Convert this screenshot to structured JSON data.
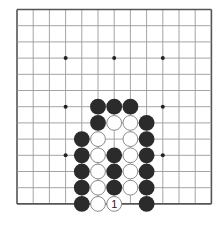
{
  "board": {
    "columns": 13,
    "rows": 13,
    "origin_x": 17,
    "origin_y": 9.5,
    "spacing": 16.2,
    "line_color": "#9a9a9a",
    "edge_color": "#555555",
    "star_points": [
      [
        3,
        3
      ],
      [
        6,
        3
      ],
      [
        9,
        3
      ],
      [
        3,
        6
      ],
      [
        9,
        6
      ],
      [
        3,
        9
      ],
      [
        9,
        9
      ]
    ]
  },
  "colors": {
    "black_stone": "#2b2b2b",
    "white_stone": "#ffffff",
    "white_outline": "#8a8a8a"
  },
  "stones": [
    {
      "color": "black",
      "col": 5,
      "row": 6
    },
    {
      "color": "black",
      "col": 6,
      "row": 6
    },
    {
      "color": "black",
      "col": 7,
      "row": 6
    },
    {
      "color": "black",
      "col": 5,
      "row": 7
    },
    {
      "color": "white",
      "col": 6,
      "row": 7
    },
    {
      "color": "white",
      "col": 7,
      "row": 7
    },
    {
      "color": "black",
      "col": 8,
      "row": 7
    },
    {
      "color": "black",
      "col": 4,
      "row": 8
    },
    {
      "color": "white",
      "col": 5,
      "row": 8
    },
    {
      "color": "white",
      "col": 7,
      "row": 8
    },
    {
      "color": "black",
      "col": 8,
      "row": 8
    },
    {
      "color": "black",
      "col": 4,
      "row": 9
    },
    {
      "color": "white",
      "col": 5,
      "row": 9
    },
    {
      "color": "black",
      "col": 6,
      "row": 9
    },
    {
      "color": "white",
      "col": 7,
      "row": 9
    },
    {
      "color": "black",
      "col": 8,
      "row": 9
    },
    {
      "color": "black",
      "col": 4,
      "row": 10
    },
    {
      "color": "white",
      "col": 5,
      "row": 10
    },
    {
      "color": "black",
      "col": 6,
      "row": 10
    },
    {
      "color": "white",
      "col": 7,
      "row": 10
    },
    {
      "color": "black",
      "col": 8,
      "row": 10
    },
    {
      "color": "black",
      "col": 4,
      "row": 11
    },
    {
      "color": "white",
      "col": 5,
      "row": 11
    },
    {
      "color": "black",
      "col": 6,
      "row": 11
    },
    {
      "color": "white",
      "col": 7,
      "row": 11
    },
    {
      "color": "black",
      "col": 8,
      "row": 11
    },
    {
      "color": "black",
      "col": 4,
      "row": 12
    },
    {
      "color": "white",
      "col": 5,
      "row": 12
    },
    {
      "color": "white",
      "col": 6,
      "row": 12,
      "label": "1"
    },
    {
      "color": "black",
      "col": 8,
      "row": 12
    }
  ]
}
